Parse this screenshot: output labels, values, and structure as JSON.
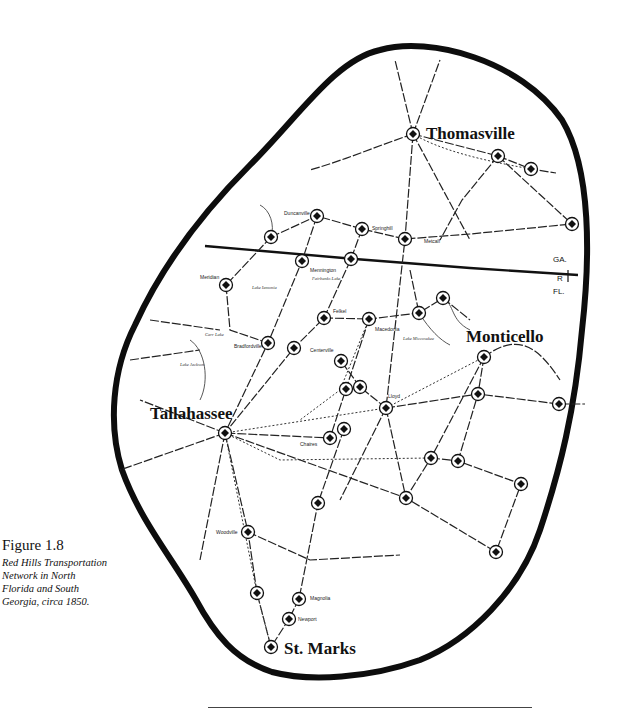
{
  "figure": {
    "number_label": "Figure 1.8",
    "caption_lines": [
      "Red Hills Transportation",
      "Network in North",
      "Florida and South",
      "Georgia, circa 1850."
    ]
  },
  "map": {
    "major_cities": [
      {
        "name": "Thomasville",
        "x": 413,
        "y": 134,
        "label_x": 426,
        "label_y": 139,
        "size": 17
      },
      {
        "name": "Monticello",
        "x": 484,
        "y": 357,
        "label_x": 466,
        "label_y": 342,
        "size": 17
      },
      {
        "name": "Tallahassee",
        "x": 225,
        "y": 433,
        "label_x": 150,
        "label_y": 419,
        "size": 17
      },
      {
        "name": "St. Marks",
        "x": 271,
        "y": 647,
        "label_x": 284,
        "label_y": 654,
        "size": 17
      }
    ],
    "towns": [
      {
        "name": "Duncanville",
        "x": 317,
        "y": 216,
        "label_x": 284,
        "label_y": 215
      },
      {
        "name": "Springhill",
        "x": 362,
        "y": 229,
        "label_x": 372,
        "label_y": 230
      },
      {
        "name": "Metcalf",
        "x": 405,
        "y": 239,
        "label_x": 424,
        "label_y": 243
      },
      {
        "name": "Mennington",
        "x": 302,
        "y": 261,
        "label_x": 310,
        "label_y": 272
      },
      {
        "name": "Meridian",
        "x": 226,
        "y": 285,
        "label_x": 200,
        "label_y": 279
      },
      {
        "name": "Felkel",
        "x": 324,
        "y": 318,
        "label_x": 333,
        "label_y": 313
      },
      {
        "name": "Macedonia",
        "x": 369,
        "y": 319,
        "label_x": 375,
        "label_y": 331
      },
      {
        "name": "Bradfordville",
        "x": 268,
        "y": 343,
        "label_x": 234,
        "label_y": 348
      },
      {
        "name": "Centerville",
        "x": 294,
        "y": 348,
        "label_x": 310,
        "label_y": 352
      },
      {
        "name": "Lloyd",
        "x": 386,
        "y": 408,
        "label_x": 388,
        "label_y": 398
      },
      {
        "name": "Chaires",
        "x": 330,
        "y": 438,
        "label_x": 300,
        "label_y": 446
      },
      {
        "name": "Woodville",
        "x": 248,
        "y": 532,
        "label_x": 216,
        "label_y": 534
      },
      {
        "name": "Magnolia",
        "x": 299,
        "y": 599,
        "label_x": 310,
        "label_y": 600
      },
      {
        "name": "Newport",
        "x": 289,
        "y": 619,
        "label_x": 298,
        "label_y": 621
      }
    ],
    "unlabeled_stations": [
      {
        "x": 271,
        "y": 237
      },
      {
        "x": 351,
        "y": 259
      },
      {
        "x": 498,
        "y": 156
      },
      {
        "x": 531,
        "y": 169
      },
      {
        "x": 572,
        "y": 224
      },
      {
        "x": 443,
        "y": 298
      },
      {
        "x": 419,
        "y": 313
      },
      {
        "x": 341,
        "y": 361
      },
      {
        "x": 346,
        "y": 389
      },
      {
        "x": 360,
        "y": 387
      },
      {
        "x": 344,
        "y": 429
      },
      {
        "x": 478,
        "y": 394
      },
      {
        "x": 559,
        "y": 404
      },
      {
        "x": 431,
        "y": 458
      },
      {
        "x": 458,
        "y": 461
      },
      {
        "x": 521,
        "y": 484
      },
      {
        "x": 406,
        "y": 498
      },
      {
        "x": 318,
        "y": 503
      },
      {
        "x": 496,
        "y": 552
      },
      {
        "x": 257,
        "y": 593
      }
    ],
    "lakes": [
      {
        "name": "Lake Iamonia",
        "x": 252,
        "y": 289
      },
      {
        "name": "Fairbanks Lake",
        "x": 312,
        "y": 280
      },
      {
        "name": "Carr Lake",
        "x": 205,
        "y": 336
      },
      {
        "name": "Lake Jackson",
        "x": 180,
        "y": 366
      },
      {
        "name": "Lake Miccosukee",
        "x": 403,
        "y": 340
      }
    ],
    "state_labels": [
      {
        "text": "GA.",
        "x": 553,
        "y": 262
      },
      {
        "text": "FL.",
        "x": 553,
        "y": 294
      }
    ],
    "state_line_marker": "R",
    "colors": {
      "ink": "#111111",
      "boundary": "#0d0d0d",
      "paper": "#ffffff"
    }
  }
}
